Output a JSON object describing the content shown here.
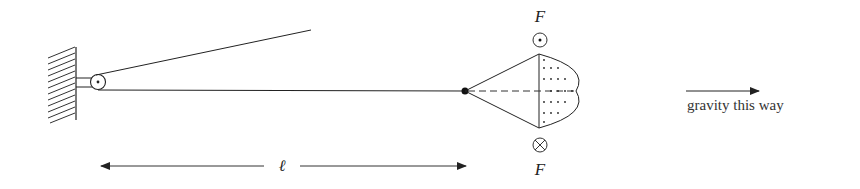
{
  "diagram": {
    "type": "physics-mechanics",
    "labels": {
      "force_top": "F",
      "force_bottom": "F",
      "length": "ℓ",
      "gravity": "gravity this way"
    },
    "symbols": {
      "force_top_symbol": "out-of-page (dot in circle)",
      "force_bottom_symbol": "into-page (cross in circle)"
    },
    "colors": {
      "stroke": "#222222",
      "background": "#ffffff"
    }
  }
}
